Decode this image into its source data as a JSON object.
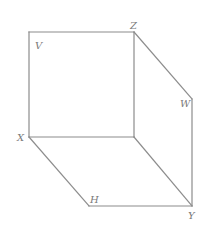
{
  "diagram": {
    "type": "geometric-figure",
    "colors": {
      "edge": "#8c8c8c",
      "label": "#7a7a7a",
      "background": "#ffffff"
    },
    "vertices": [
      {
        "id": "TL",
        "label": "",
        "x": 29,
        "y": 32
      },
      {
        "id": "Z",
        "label": "Z",
        "x": 134,
        "y": 32
      },
      {
        "id": "C",
        "label": "",
        "x": 134,
        "y": 137
      },
      {
        "id": "X",
        "label": "X",
        "x": 29,
        "y": 137
      },
      {
        "id": "W",
        "label": "W",
        "x": 192,
        "y": 99
      },
      {
        "id": "Y",
        "label": "Y",
        "x": 192,
        "y": 206
      },
      {
        "id": "H",
        "label": "H",
        "x": 89,
        "y": 206
      }
    ],
    "edges": [
      [
        "TL",
        "Z"
      ],
      [
        "Z",
        "C"
      ],
      [
        "C",
        "X"
      ],
      [
        "X",
        "TL"
      ],
      [
        "Z",
        "W"
      ],
      [
        "W",
        "Y"
      ],
      [
        "X",
        "H"
      ],
      [
        "H",
        "Y"
      ],
      [
        "C",
        "Y"
      ]
    ],
    "labels": [
      {
        "text": "V",
        "x": 35,
        "y": 49
      },
      {
        "text": "Z",
        "x": 130,
        "y": 29
      },
      {
        "text": "W",
        "x": 180,
        "y": 107
      },
      {
        "text": "X",
        "x": 17,
        "y": 141
      },
      {
        "text": "H",
        "x": 90,
        "y": 203
      },
      {
        "text": "Y",
        "x": 188,
        "y": 219
      }
    ]
  }
}
